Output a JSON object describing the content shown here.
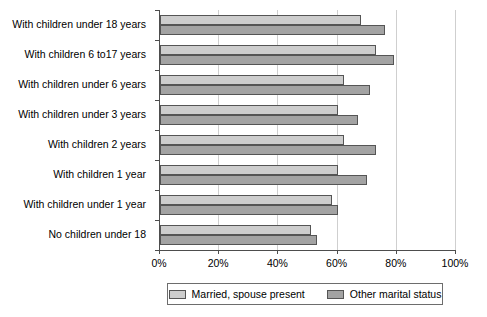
{
  "chart_data": {
    "type": "bar",
    "orientation": "horizontal",
    "title": "",
    "xlabel": "",
    "ylabel": "",
    "xlim": [
      0,
      100
    ],
    "grid": true,
    "legend_position": "bottom",
    "tick_labels": [
      "0%",
      "20%",
      "40%",
      "60%",
      "80%",
      "100%"
    ],
    "ticks": [
      0,
      20,
      40,
      60,
      80,
      100
    ],
    "categories": [
      "With children under 18 years",
      "With children 6 to17 years",
      "With children under 6 years",
      "With children under 3 years",
      "With children 2 years",
      "With children 1 year",
      "With children under 1 year",
      "No children under 18"
    ],
    "series": [
      {
        "name": "Married, spouse present",
        "color": "#cdcdcd",
        "values": [
          68,
          73,
          62,
          60,
          62,
          60,
          58,
          51
        ]
      },
      {
        "name": "Other marital status",
        "color": "#a3a3a3",
        "values": [
          76,
          79,
          71,
          67,
          73,
          70,
          60,
          53
        ]
      }
    ]
  },
  "legend": {
    "items": [
      {
        "label": "Married, spouse present"
      },
      {
        "label": "Other marital status"
      }
    ]
  }
}
